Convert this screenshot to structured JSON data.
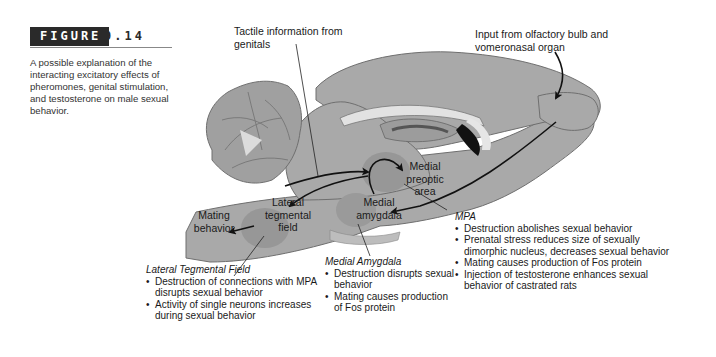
{
  "figure": {
    "label": "FIGURE",
    "number": "9.14",
    "caption": "A possible explanation of the interacting excitatory effects of pheromones, genital stimulation, and testosterone on male sexual behavior."
  },
  "labels": {
    "tactile": "Tactile information from genitals",
    "olfactory": "Input from olfactory bulb and vomeronasal organ",
    "mating": "Mating behavior",
    "ltf": "Lateral tegmental field",
    "mpa": "Medial preoptic area",
    "amygdala": "Medial amygdala"
  },
  "notes": {
    "ltf": {
      "title": "Lateral Tegmental Field",
      "items": [
        "Destruction of connections with MPA disrupts sexual behavior",
        "Activity of single neurons increases during sexual behavior"
      ]
    },
    "amygdala": {
      "title": "Medial Amygdala",
      "items": [
        "Destruction disrupts sexual behavior",
        "Mating causes production of Fos protein"
      ]
    },
    "mpa": {
      "title": "MPA",
      "items": [
        "Destruction abolishes sexual behavior",
        "Prenatal stress reduces size of sexually dimorphic nucleus, decreases sexual behavior",
        "Mating causes production of Fos protein",
        "Injection of testosterone enhances sexual behavior of castrated rats"
      ]
    }
  },
  "colors": {
    "tissue": "#a9a9a9",
    "tissue_dark": "#8f8f8f",
    "region_highlight": "#969696",
    "label_bg": "#2a2a2a"
  }
}
